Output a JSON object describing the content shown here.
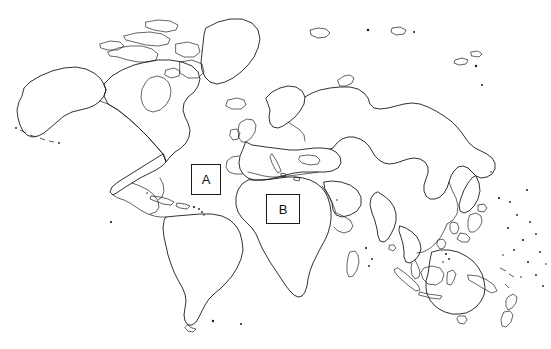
{
  "document": {
    "type": "world-map-outline-quiz",
    "title": "World Map Outline with Labeled Regions",
    "background_color": "#ffffff",
    "line_color": "#1a1a1a",
    "projection": "mercator-style world outline",
    "width": 551,
    "height": 349
  },
  "markers": [
    {
      "id": "A",
      "label": "A",
      "x": 191,
      "y": 164,
      "width": 30,
      "height": 31,
      "region": "North Atlantic Ocean",
      "fill": "#ffffff",
      "border_color": "#1a1a1a"
    },
    {
      "id": "B",
      "label": "B",
      "x": 266,
      "y": 194,
      "width": 34,
      "height": 30,
      "region": "North Africa / Sahara",
      "fill": "#ffffff",
      "border_color": "#1a1a1a"
    }
  ],
  "landmasses": [
    "North America",
    "Greenland",
    "Iceland",
    "South America",
    "Central America",
    "Caribbean Islands",
    "Europe",
    "Scandinavia",
    "British Isles",
    "Africa",
    "Madagascar",
    "Arabian Peninsula",
    "Asia",
    "Siberia",
    "Kamchatka Peninsula",
    "Japan",
    "India",
    "Southeast Asia",
    "Indonesia",
    "Philippines",
    "Australia",
    "New Zealand",
    "Pacific Islands",
    "Falkland Islands",
    "Aleutian Islands",
    "Svalbard",
    "Novaya Zemlya"
  ]
}
